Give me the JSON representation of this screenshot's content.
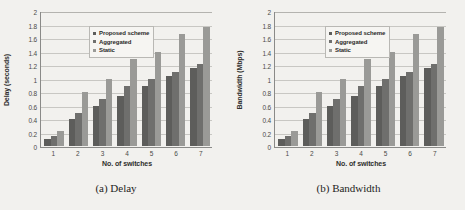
{
  "figure": {
    "panels": [
      {
        "caption": "(a) Delay",
        "chart_data": {
          "type": "bar",
          "title": "",
          "xlabel": "No. of switches",
          "ylabel": "Delay (seconds)",
          "categories": [
            "1",
            "2",
            "3",
            "4",
            "5",
            "6",
            "7"
          ],
          "yticks": [
            "0",
            "0.2",
            "0.4",
            "0.6",
            "0.8",
            "1",
            "1.2",
            "1.4",
            "1.6",
            "1.8",
            "2"
          ],
          "ylim": [
            0,
            2
          ],
          "grid": true,
          "legend_position": "top-left",
          "series": [
            {
              "name": "Proposed scheme",
              "color": "#5d5d5b",
              "values": [
                0.1,
                0.4,
                0.6,
                0.75,
                0.9,
                1.05,
                1.16
              ]
            },
            {
              "name": "Aggregated",
              "color": "#6f6f6d",
              "values": [
                0.15,
                0.5,
                0.7,
                0.9,
                1.0,
                1.1,
                1.23
              ]
            },
            {
              "name": "Static",
              "color": "#9a9a97",
              "values": [
                0.22,
                0.8,
                1.0,
                1.3,
                1.4,
                1.67,
                1.77
              ]
            }
          ]
        }
      },
      {
        "caption": "(b) Bandwidth",
        "chart_data": {
          "type": "bar",
          "title": "",
          "xlabel": "No. of switches",
          "ylabel": "Bandwidth (Mbps)",
          "categories": [
            "1",
            "2",
            "3",
            "4",
            "5",
            "6",
            "7"
          ],
          "yticks": [
            "0",
            "0.2",
            "0.4",
            "0.6",
            "0.8",
            "1",
            "1.2",
            "1.4",
            "1.6",
            "1.8",
            "2"
          ],
          "ylim": [
            0,
            2
          ],
          "grid": true,
          "legend_position": "top-left",
          "series": [
            {
              "name": "Proposed scheme",
              "color": "#5d5d5b",
              "values": [
                0.1,
                0.4,
                0.6,
                0.75,
                0.9,
                1.05,
                1.16
              ]
            },
            {
              "name": "Aggregated",
              "color": "#6f6f6d",
              "values": [
                0.15,
                0.5,
                0.7,
                0.9,
                1.0,
                1.1,
                1.23
              ]
            },
            {
              "name": "Static",
              "color": "#9a9a97",
              "values": [
                0.22,
                0.8,
                1.0,
                1.3,
                1.4,
                1.67,
                1.77
              ]
            }
          ]
        }
      }
    ]
  }
}
